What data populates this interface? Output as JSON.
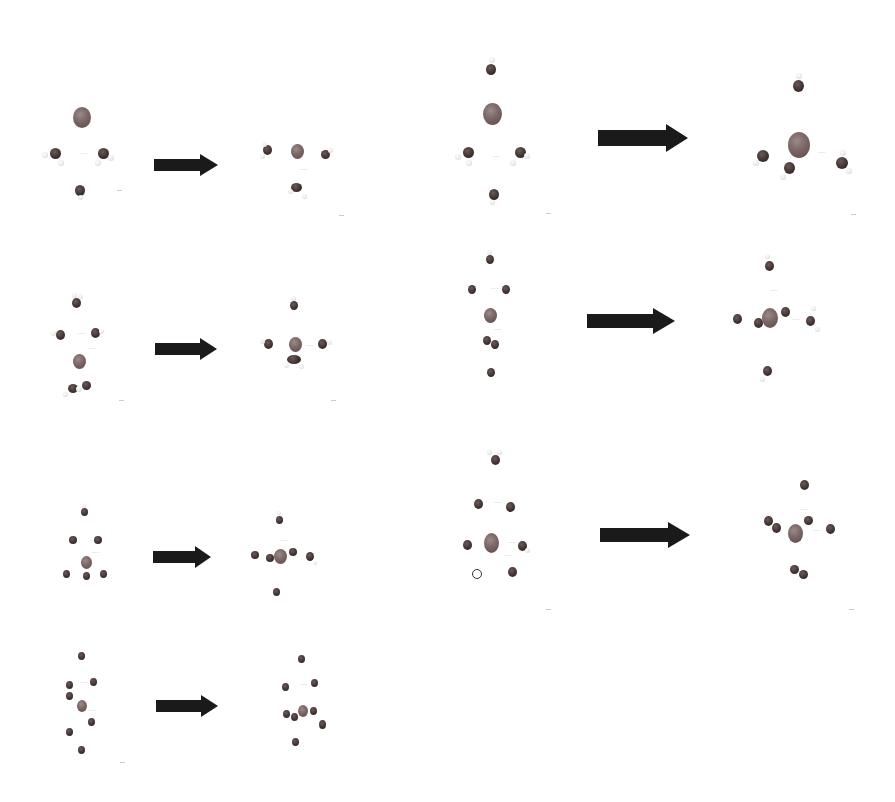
{
  "figure": {
    "colors": {
      "ion": "#7a6664",
      "oxygen": "#3d302f",
      "hydrogen": "#e6e6e6",
      "arrow": "#1a1a1a",
      "background": "#ffffff"
    },
    "panels": [
      {
        "id": "left-1",
        "arrow": "right-arrow",
        "label_marks": [
          "·····",
          "·····"
        ]
      },
      {
        "id": "left-2",
        "arrow": "right-arrow",
        "label_marks": [
          "·····",
          "·····",
          "·····"
        ]
      },
      {
        "id": "left-3",
        "arrow": "right-arrow",
        "label_marks": [
          "·····",
          "·····",
          "·····"
        ]
      },
      {
        "id": "left-4",
        "arrow": "right-arrow",
        "label_marks": [
          "·····",
          "·····",
          "·····"
        ]
      },
      {
        "id": "right-1",
        "arrow": "right-arrow",
        "label_marks": [
          "·····",
          "·····"
        ]
      },
      {
        "id": "right-2",
        "arrow": "right-arrow",
        "label_marks": [
          "·····",
          "·····",
          "·····",
          "·····"
        ]
      },
      {
        "id": "right-3",
        "arrow": "right-arrow",
        "label_marks": [
          "·····",
          "·····",
          "·····",
          "·····",
          "·····"
        ]
      }
    ]
  }
}
